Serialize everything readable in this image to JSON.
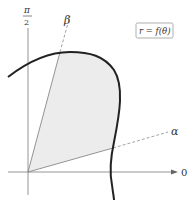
{
  "diagram": {
    "type": "polar-region",
    "axis_labels": {
      "vertical_top": "π",
      "vertical_bottom": "2",
      "horizontal": "0"
    },
    "ray_labels": {
      "beta": "β",
      "alpha": "α"
    },
    "equation_box": "r = f(θ)",
    "colors": {
      "curve": "#222222",
      "axis": "#888888",
      "ray": "#999999",
      "shaded_region": "#ececec",
      "box_border": "#999999"
    }
  }
}
